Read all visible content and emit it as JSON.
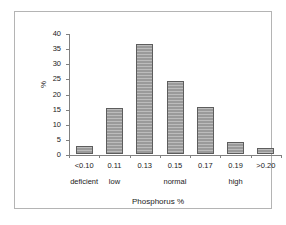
{
  "chart_data": {
    "type": "bar",
    "title": "",
    "xlabel": "Phosphorus %",
    "ylabel": "%",
    "categories": [
      "<0.10",
      "0.11",
      "0.13",
      "0.15",
      "0.17",
      "0.19",
      ">0.20"
    ],
    "values": [
      2.8,
      15.3,
      36.3,
      24.2,
      15.5,
      3.9,
      2.1
    ],
    "ylim": [
      0,
      40
    ],
    "ytick_labels": [
      "0",
      "5",
      "10",
      "15",
      "20",
      "25",
      "30",
      "35",
      "40"
    ],
    "ytick_values": [
      0,
      5,
      10,
      15,
      20,
      25,
      30,
      35,
      40
    ],
    "grid": false,
    "legend": "none",
    "group_labels": [
      {
        "label": "deficient",
        "at_category": "<0.10"
      },
      {
        "label": "low",
        "at_category": "0.11"
      },
      {
        "label": "normal",
        "at_category": "0.15"
      },
      {
        "label": "high",
        "at_category": "0.19"
      }
    ],
    "bar_color": "#9a9a9a",
    "bar_edge_color": "#5d5d5d",
    "axis_color": "#808080",
    "frame_color": "#b4b4b4",
    "background_color": "#ffffff"
  }
}
